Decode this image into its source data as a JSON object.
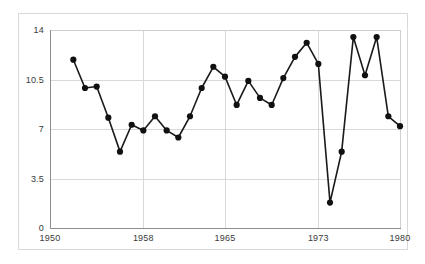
{
  "chart_data": {
    "type": "line",
    "title": "",
    "subtitle": "",
    "xlabel": "",
    "ylabel": "",
    "xlim": [
      1950,
      1980
    ],
    "ylim": [
      0,
      14
    ],
    "grid": true,
    "legend": "none",
    "marker": "filled-circle",
    "line_color": "#1a1a1a",
    "marker_color": "#111111",
    "grid_color": "#d9d9d9",
    "axis_color": "#8d8d8d",
    "tick_label_color": "#3a3a3a",
    "background_color": "#ffffff",
    "x_ticks": [
      1950,
      1958,
      1965,
      1973,
      1980
    ],
    "x_tick_labels": [
      "1950",
      "1958",
      "1965",
      "1973",
      "1980"
    ],
    "y_ticks": [
      0,
      3.5,
      7,
      10.5,
      14
    ],
    "y_tick_labels": [
      "0",
      "3.5",
      "7",
      "10.5",
      "14"
    ],
    "x": [
      1952,
      1953,
      1954,
      1955,
      1956,
      1957,
      1958,
      1959,
      1960,
      1961,
      1962,
      1963,
      1964,
      1965,
      1966,
      1967,
      1968,
      1969,
      1970,
      1971,
      1972,
      1973,
      1974,
      1975,
      1976,
      1977,
      1978,
      1979,
      1980
    ],
    "values": [
      11.9,
      9.9,
      10.0,
      7.8,
      5.4,
      7.3,
      6.9,
      7.9,
      6.9,
      6.4,
      7.9,
      9.9,
      11.4,
      10.7,
      8.7,
      10.4,
      9.2,
      8.7,
      10.6,
      12.1,
      13.1,
      11.6,
      1.8,
      5.4,
      13.5,
      10.8,
      13.5,
      7.9,
      7.2
    ],
    "point_count": 29
  }
}
